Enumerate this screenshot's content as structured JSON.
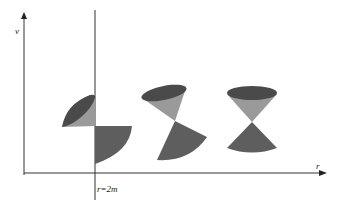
{
  "diagram": {
    "axes": {
      "vertical_label": "v",
      "horizontal_label": "r",
      "boundary_label": "r=2m"
    },
    "colors": {
      "axis": "#333333",
      "cone_dark": "#4a4a4a",
      "cone_mid": "#5e5e5e",
      "cone_light": "#9a9a9a"
    },
    "light_cones": [
      {
        "position": "at r=2m",
        "tilt": "strongly tilted"
      },
      {
        "position": "intermediate",
        "tilt": "partially tilted"
      },
      {
        "position": "far",
        "tilt": "upright"
      }
    ]
  }
}
